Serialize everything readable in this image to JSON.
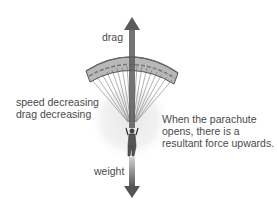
{
  "diagram": {
    "forces": {
      "up": {
        "label": "drag",
        "direction": "up"
      },
      "down": {
        "label": "weight",
        "direction": "down"
      }
    },
    "left_note": {
      "lines": [
        "speed decreasing",
        "drag decreasing"
      ]
    },
    "right_note": {
      "lines": [
        "When the parachute",
        "opens, there is a",
        "resultant force upwards."
      ]
    },
    "colors": {
      "arrow": "#5a5a5a",
      "canopy": "#9a9a9a",
      "canopy_dark": "#555555",
      "glow": "#efefef",
      "text": "#4a4a4a"
    }
  }
}
